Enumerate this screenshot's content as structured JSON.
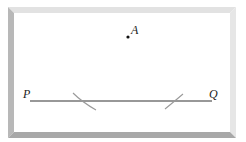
{
  "diagram": {
    "type": "geometry-construction",
    "points": [
      {
        "label": "A",
        "x": 128,
        "y": 37
      },
      {
        "label": "P",
        "x": 30,
        "y": 101
      },
      {
        "label": "Q",
        "x": 212,
        "y": 101
      }
    ],
    "segments": [
      {
        "from": "P",
        "to": "Q"
      }
    ],
    "arcs": [
      {
        "name": "left-arc",
        "crosses_line_at_x": 81
      },
      {
        "name": "right-arc",
        "crosses_line_at_x": 176
      }
    ],
    "labels": {
      "A": "A",
      "P": "P",
      "Q": "Q"
    },
    "colors": {
      "frame_top": "#e2e2e2",
      "frame_right": "#e6e6e6",
      "frame_left": "#b8b8b8",
      "frame_bottom": "#a8a8a8",
      "line": "#333333",
      "arc": "#9a9a9a",
      "background": "#ffffff"
    }
  }
}
